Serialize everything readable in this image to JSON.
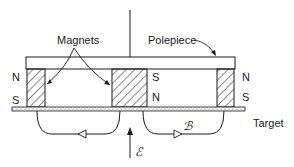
{
  "labels": {
    "magnets": "Magnets",
    "polepiece": "Polepiece",
    "target": "Target",
    "field_b": "ℬ",
    "field_e": "ℰ"
  },
  "poles": {
    "left_top": "N",
    "left_bottom": "S",
    "middle_top": "S",
    "middle_bottom": "N",
    "right_top": "N",
    "right_bottom": "S"
  },
  "colors": {
    "stroke": "#1a1a1a",
    "background": "#ffffff"
  }
}
